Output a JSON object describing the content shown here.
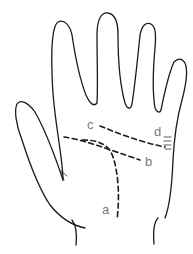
{
  "diagram": {
    "type": "palm-lines-illustration",
    "colors": {
      "outline": "#1a1a1a",
      "label": "#7a7a7a",
      "background": "#ffffff"
    },
    "labels": {
      "a": "a",
      "b": "b",
      "c": "c",
      "d": "d"
    },
    "lines": [
      {
        "id": "a",
        "style": "dashed",
        "description": "curved line around thumb base"
      },
      {
        "id": "b",
        "style": "dashed",
        "description": "line across middle of palm"
      },
      {
        "id": "c",
        "style": "dashed",
        "description": "upper line across palm"
      },
      {
        "id": "d",
        "style": "short-marks",
        "description": "small marks on palm edge below little finger"
      }
    ]
  }
}
